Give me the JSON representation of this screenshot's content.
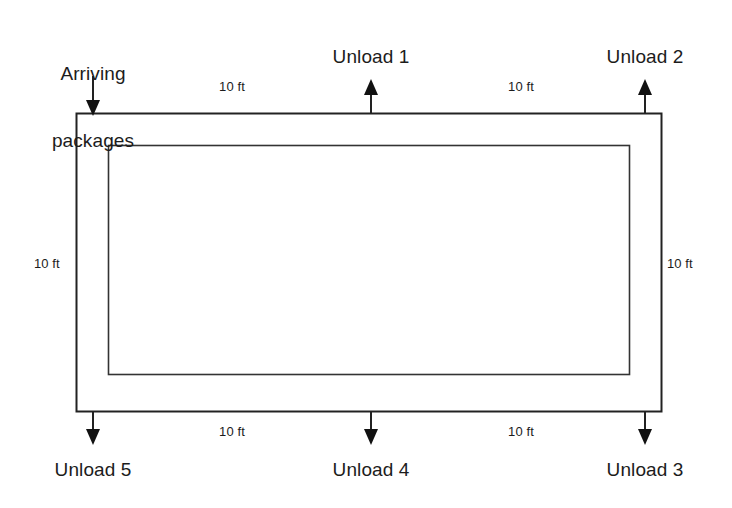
{
  "diagram": {
    "source_label": {
      "line1": "Arriving",
      "line2": "packages"
    },
    "stations": [
      {
        "id": "unload-1",
        "label": "Unload 1",
        "side": "top",
        "direction": "out"
      },
      {
        "id": "unload-2",
        "label": "Unload 2",
        "side": "top",
        "direction": "out"
      },
      {
        "id": "unload-3",
        "label": "Unload 3",
        "side": "bottom",
        "direction": "out"
      },
      {
        "id": "unload-4",
        "label": "Unload 4",
        "side": "bottom",
        "direction": "out"
      },
      {
        "id": "unload-5",
        "label": "Unload 5",
        "side": "bottom",
        "direction": "out"
      }
    ],
    "dimensions": [
      {
        "id": "dim-top-left",
        "text": "10 ft",
        "segment": "top-left"
      },
      {
        "id": "dim-top-right",
        "text": "10 ft",
        "segment": "top-right"
      },
      {
        "id": "dim-left",
        "text": "10 ft",
        "segment": "left"
      },
      {
        "id": "dim-right",
        "text": "10 ft",
        "segment": "right"
      },
      {
        "id": "dim-bottom-left",
        "text": "10 ft",
        "segment": "bottom-left"
      },
      {
        "id": "dim-bottom-right",
        "text": "10 ft",
        "segment": "bottom-right"
      }
    ],
    "colors": {
      "background": "#ffffff",
      "line": "#222222",
      "text": "#1c1c1c"
    }
  }
}
